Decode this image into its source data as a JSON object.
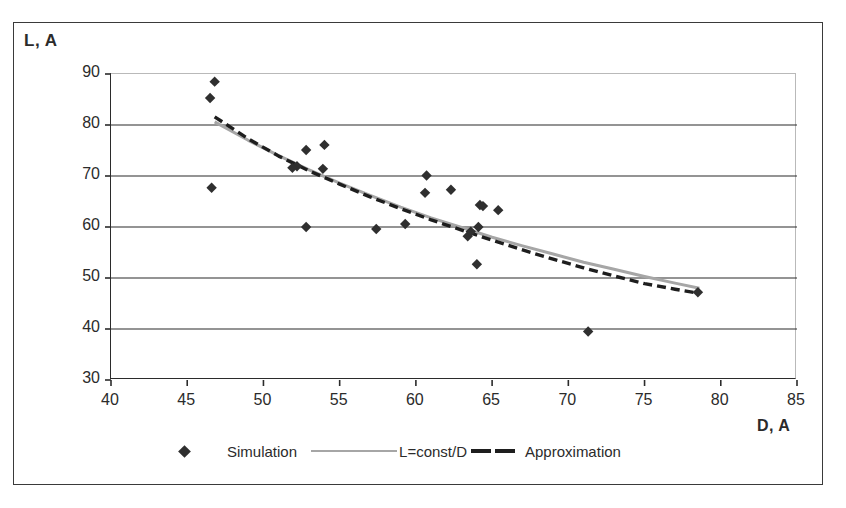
{
  "axes": {
    "y_title": "L, A",
    "x_title": "D, A"
  },
  "legend": {
    "items": [
      {
        "label": "Simulation",
        "marker": "diamond-marker",
        "color": "#2f2f2f"
      },
      {
        "label": "L=const/D",
        "marker": "solid-line",
        "color": "#a6a6a6"
      },
      {
        "label": "Approximation",
        "marker": "dashed-line",
        "color": "#1e1e1e"
      }
    ]
  },
  "chart_data": {
    "type": "scatter",
    "title": "",
    "xlabel": "D, A",
    "ylabel": "L, A",
    "xlim": [
      40,
      85
    ],
    "ylim": [
      30,
      90
    ],
    "xticks": [
      40,
      45,
      50,
      55,
      60,
      65,
      70,
      75,
      80,
      85
    ],
    "yticks": [
      30,
      40,
      50,
      60,
      70,
      80,
      90
    ],
    "grid": "horizontal",
    "legend_position": "bottom",
    "series": [
      {
        "name": "Simulation",
        "type": "scatter",
        "marker": "diamond",
        "color": "#2f2f2f",
        "points": [
          [
            46.8,
            88.5
          ],
          [
            46.5,
            85.3
          ],
          [
            46.6,
            67.7
          ],
          [
            52.8,
            75.1
          ],
          [
            54.0,
            76.1
          ],
          [
            52.2,
            71.9
          ],
          [
            51.9,
            71.6
          ],
          [
            53.9,
            71.4
          ],
          [
            52.8,
            60.0
          ],
          [
            57.4,
            59.6
          ],
          [
            59.3,
            60.6
          ],
          [
            60.6,
            66.7
          ],
          [
            60.7,
            70.1
          ],
          [
            62.3,
            67.3
          ],
          [
            63.4,
            58.2
          ],
          [
            63.6,
            59.1
          ],
          [
            64.2,
            64.3
          ],
          [
            64.4,
            64.1
          ],
          [
            65.4,
            63.3
          ],
          [
            64.1,
            60.0
          ],
          [
            64.0,
            52.7
          ],
          [
            71.3,
            39.5
          ],
          [
            78.5,
            47.2
          ]
        ]
      },
      {
        "name": "L=const/D",
        "type": "line",
        "style": "solid",
        "color": "#a6a6a6",
        "points": [
          [
            46.8,
            80.6
          ],
          [
            49.0,
            77.0
          ],
          [
            51.0,
            74.0
          ],
          [
            53.0,
            71.2
          ],
          [
            55.0,
            68.6
          ],
          [
            57.0,
            66.2
          ],
          [
            59.0,
            63.9
          ],
          [
            61.0,
            61.8
          ],
          [
            63.0,
            59.9
          ],
          [
            65.0,
            58.0
          ],
          [
            67.0,
            56.3
          ],
          [
            69.0,
            54.7
          ],
          [
            71.0,
            53.1
          ],
          [
            73.0,
            51.7
          ],
          [
            75.0,
            50.3
          ],
          [
            77.0,
            49.0
          ],
          [
            78.6,
            48.0
          ]
        ]
      },
      {
        "name": "Approximation",
        "type": "line",
        "style": "dashed",
        "color": "#1e1e1e",
        "points": [
          [
            46.8,
            81.6
          ],
          [
            49.0,
            77.3
          ],
          [
            51.0,
            73.9
          ],
          [
            53.0,
            71.0
          ],
          [
            55.0,
            68.4
          ],
          [
            57.0,
            65.9
          ],
          [
            59.0,
            63.6
          ],
          [
            61.0,
            61.4
          ],
          [
            63.0,
            59.4
          ],
          [
            65.0,
            57.4
          ],
          [
            67.0,
            55.5
          ],
          [
            69.0,
            53.7
          ],
          [
            71.0,
            52.0
          ],
          [
            73.0,
            50.4
          ],
          [
            75.0,
            48.9
          ],
          [
            77.0,
            47.8
          ],
          [
            78.6,
            47.0
          ]
        ]
      }
    ]
  }
}
